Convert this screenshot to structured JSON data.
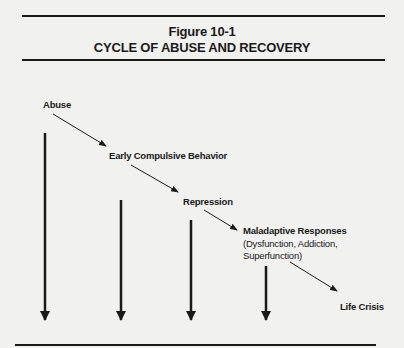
{
  "figure": {
    "number": "Figure 10-1",
    "title": "CYCLE OF ABUSE AND RECOVERY"
  },
  "nodes": [
    {
      "id": "abuse",
      "label": "Abuse"
    },
    {
      "id": "early",
      "label": "Early Compulsive Behavior"
    },
    {
      "id": "repression",
      "label": "Repression"
    },
    {
      "id": "maladaptive",
      "label": "Maladaptive Responses",
      "detail_line1": "(Dysfunction, Addiction,",
      "detail_line2": "Superfunction)"
    },
    {
      "id": "crisis",
      "label": "Life Crisis"
    }
  ],
  "edges": [
    {
      "from": "abuse",
      "to": "early",
      "type": "diagonal-arrow"
    },
    {
      "from": "early",
      "to": "repression",
      "type": "diagonal-arrow"
    },
    {
      "from": "repression",
      "to": "maladaptive",
      "type": "diagonal-arrow"
    },
    {
      "from": "maladaptive",
      "to": "crisis",
      "type": "diagonal-arrow"
    }
  ],
  "vertical_arrows": [
    {
      "under": "abuse",
      "x": 45,
      "top": 133,
      "bottom": 320
    },
    {
      "under": "early",
      "x": 121,
      "top": 200,
      "bottom": 320
    },
    {
      "under": "repression",
      "x": 191,
      "top": 220,
      "bottom": 320
    },
    {
      "under": "maladaptive",
      "x": 266,
      "top": 266,
      "bottom": 320
    }
  ],
  "colors": {
    "background": "#f1f1ef",
    "ink": "#1a1a1a"
  }
}
